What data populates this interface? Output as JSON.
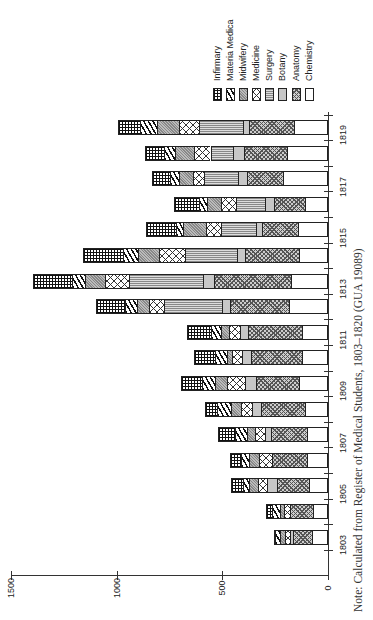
{
  "chart_data": {
    "type": "bar",
    "stacked": true,
    "orientation": "rotated (bars extend leftward from axis; page rotated 90°)",
    "title": "",
    "xlabel": "",
    "ylabel": "",
    "ylim": [
      0,
      1500
    ],
    "yticks": [
      0,
      500,
      1000,
      1500
    ],
    "categories": [
      "1803",
      "1804",
      "1805",
      "1806",
      "1807",
      "1808",
      "1809",
      "1810",
      "1811",
      "1812",
      "1813",
      "1814",
      "1815",
      "1816",
      "1817",
      "1818",
      "1819"
    ],
    "xtick_labels": [
      "1803",
      "1805",
      "1807",
      "1809",
      "1811",
      "1813",
      "1815",
      "1817",
      "1819"
    ],
    "legend": [
      "Infirmary",
      "Materia Medica",
      "Midwifery",
      "Medicine",
      "Surgery",
      "Botany",
      "Anatomy",
      "Chemistry"
    ],
    "series": [
      {
        "name": "Chemistry",
        "key": "chemistry",
        "values": [
          75,
          71,
          90,
          99,
          99,
          108,
          137,
          123,
          123,
          184,
          175,
          137,
          141,
          108,
          212,
          193,
          160
        ]
      },
      {
        "name": "Anatomy",
        "key": "anatomy",
        "values": [
          90,
          108,
          151,
          165,
          170,
          208,
          203,
          240,
          255,
          278,
          363,
          255,
          170,
          146,
          170,
          203,
          212
        ]
      },
      {
        "name": "Botany",
        "key": "botany",
        "values": [
          15,
          0,
          47,
          0,
          28,
          42,
          52,
          42,
          38,
          38,
          52,
          38,
          28,
          42,
          42,
          52,
          28
        ]
      },
      {
        "name": "Surgery",
        "key": "surgery",
        "values": [
          0,
          0,
          0,
          0,
          0,
          0,
          0,
          0,
          0,
          274,
          354,
          245,
          165,
          141,
          165,
          108,
          212
        ]
      },
      {
        "name": "Medicine",
        "key": "medicine",
        "values": [
          25,
          28,
          42,
          61,
          47,
          52,
          85,
          47,
          52,
          75,
          113,
          123,
          75,
          71,
          52,
          80,
          94
        ]
      },
      {
        "name": "Midwifery",
        "key": "midwifery",
        "values": [
          20,
          19,
          42,
          47,
          38,
          47,
          57,
          28,
          38,
          57,
          94,
          99,
          108,
          66,
          66,
          90,
          104
        ]
      },
      {
        "name": "Materia Medica",
        "key": "materia",
        "values": [
          25,
          38,
          28,
          38,
          57,
          66,
          61,
          57,
          47,
          57,
          61,
          71,
          33,
          38,
          42,
          52,
          80
        ]
      },
      {
        "name": "Infirmary",
        "key": "infirmary",
        "values": [
          5,
          28,
          61,
          52,
          80,
          61,
          99,
          99,
          113,
          137,
          184,
          193,
          141,
          118,
          85,
          90,
          104
        ]
      }
    ],
    "totals": [
      255,
      292,
      461,
      462,
      519,
      584,
      694,
      636,
      666,
      1100,
      1396,
      1161,
      861,
      730,
      834,
      868,
      994
    ],
    "grid": false,
    "legend_position": "top-right"
  },
  "axis": {
    "y_tick_labels": [
      "0",
      "500",
      "1000",
      "1500"
    ]
  },
  "note": "Note: Calculated from Register of Medical Students, 1803–1820 (GUA 19089)"
}
